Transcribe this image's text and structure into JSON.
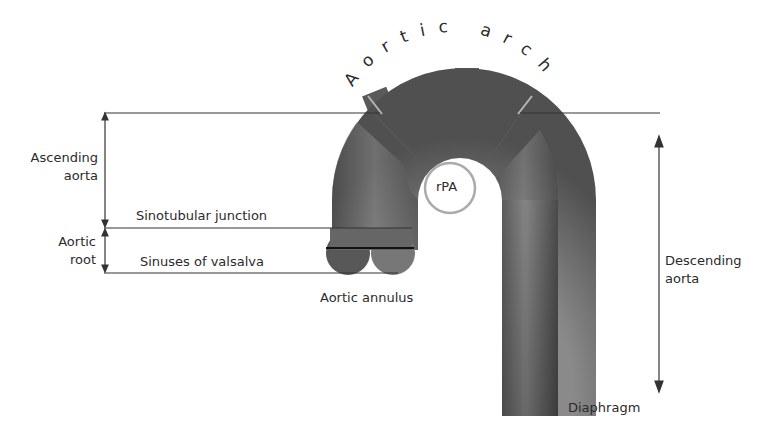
{
  "title": "Aortic arch",
  "labels": {
    "aortic_arch": "Aortic arch",
    "ascending_aorta_line1": "Ascending",
    "ascending_aorta_line2": "aorta",
    "aortic_root_line1": "Aortic",
    "aortic_root_line2": "root",
    "sinotubular_junction": "Sinotubular junction",
    "sinuses_of_valsalva": "Sinuses of valsalva",
    "aortic_annulus": "Aortic annulus",
    "rpa": "rPA",
    "descending_aorta_line1": "Descending",
    "descending_aorta_line2": "aorta",
    "diaphragm": "Diaphragm"
  },
  "colors": {
    "vessel_dark": "#4a4a4a",
    "vessel_light": "#8c8c8c",
    "line": "#333333",
    "rpa_ring": "#aaaaaa"
  }
}
